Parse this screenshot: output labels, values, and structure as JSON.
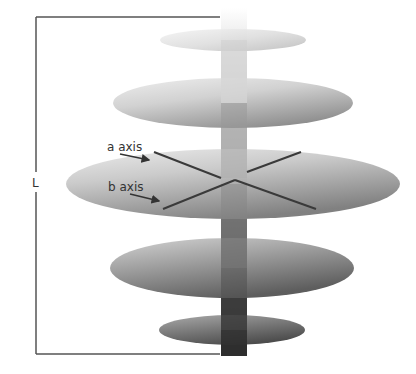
{
  "diagram": {
    "type": "stacked-discs-on-rod",
    "length_label": "L",
    "axis_labels": {
      "a": "a axis",
      "b": "b axis"
    },
    "discs": [
      {
        "name": "top-disc",
        "cx": 233,
        "cy": 40,
        "rx": 73,
        "ry": 11,
        "light": "#f2f2f2",
        "dark": "#b8b8b8"
      },
      {
        "name": "upper-disc",
        "cx": 233,
        "cy": 103,
        "rx": 120,
        "ry": 25,
        "light": "#ececec",
        "dark": "#8e8e8e"
      },
      {
        "name": "middle-disc",
        "cx": 233,
        "cy": 184,
        "rx": 167,
        "ry": 35,
        "light": "#e6e6e6",
        "dark": "#7a7a7a"
      },
      {
        "name": "lower-disc",
        "cx": 232,
        "cy": 268,
        "rx": 122,
        "ry": 30,
        "light": "#cfcfcf",
        "dark": "#595959"
      },
      {
        "name": "bottom-disc",
        "cx": 232,
        "cy": 330,
        "rx": 73,
        "ry": 15,
        "light": "#a8a8a8",
        "dark": "#4a4a4a"
      }
    ],
    "rod": {
      "x": 221,
      "y_top": 8,
      "y_bottom": 356,
      "width": 26,
      "color_top": "#ffffff",
      "color_bottom": "#2e2e2e"
    },
    "bracket": {
      "x_left": 36,
      "x_right": 220,
      "y_top": 17,
      "y_bottom": 354,
      "color": "#555555"
    },
    "colors": {
      "axis_line": "#3a3a3a",
      "text": "#333333",
      "background": "#ffffff"
    }
  }
}
